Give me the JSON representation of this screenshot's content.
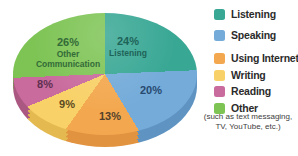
{
  "chart_data": {
    "type": "pie",
    "style": "3d",
    "title": "",
    "categories": [
      "Listening",
      "Speaking",
      "Using Internet",
      "Writing",
      "Reading",
      "Other"
    ],
    "values": [
      24,
      20,
      13,
      9,
      8,
      26
    ],
    "unit": "%",
    "colors": [
      "#38a794",
      "#74abd9",
      "#f3a84f",
      "#f8d168",
      "#c96b9d",
      "#7ec455"
    ],
    "depth_colors": [
      "#2b8a7a",
      "#5e93c2",
      "#e2933f",
      "#e3b950",
      "#aa5781",
      "#68a846"
    ],
    "legend_position": "right",
    "slice_label_colors": {
      "listening": "#1e6358",
      "speaking": "#27496f",
      "using_internet": "#54402a",
      "writing": "#5c4a22",
      "reading": "#5f3050",
      "other": "#336b38"
    }
  },
  "pie_labels": {
    "listening": {
      "pct": "24%",
      "name": "Listening"
    },
    "speaking": {
      "pct": "20%"
    },
    "using_internet": {
      "pct": "13%"
    },
    "writing": {
      "pct": "9%"
    },
    "reading": {
      "pct": "8%"
    },
    "other": {
      "pct": "26%",
      "name_line1": "Other",
      "name_line2": "Communication"
    }
  },
  "legend": {
    "items": [
      {
        "label": "Listening",
        "color": "#38a794"
      },
      {
        "label": "Speaking",
        "color": "#74abd9"
      },
      {
        "label": "Using Internet",
        "color": "#f3a84f"
      },
      {
        "label": "Writing",
        "color": "#f8d168"
      },
      {
        "label": "Reading",
        "color": "#c96b9d"
      },
      {
        "label": "Other",
        "color": "#7ec455"
      }
    ],
    "note_line1": "(such as text messaging,",
    "note_line2": "TV, YouTube, etc.)"
  }
}
